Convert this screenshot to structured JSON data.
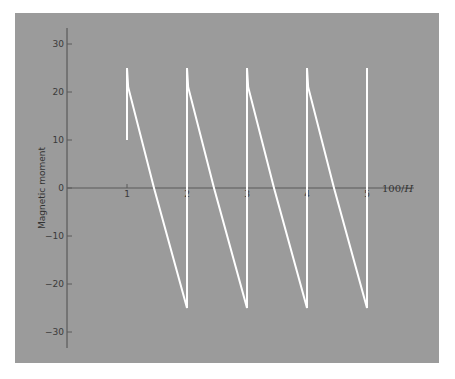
{
  "chart_data": {
    "type": "line",
    "title": "",
    "xlabel": "100/H",
    "xlabel_parts": {
      "prefix": "100/",
      "var": "H"
    },
    "ylabel": "Magnetic moment",
    "xlim": [
      0,
      5.8
    ],
    "ylim": [
      -33,
      33
    ],
    "xticks": [
      1,
      2,
      3,
      4,
      5
    ],
    "xtick_labels": [
      "1",
      "2",
      "3",
      "4",
      "5"
    ],
    "yticks": [
      30,
      20,
      10,
      0,
      -10,
      -20,
      -30
    ],
    "ytick_labels": [
      "30",
      "20",
      "10",
      "0",
      "−10",
      "−20",
      "−30"
    ],
    "grid": false,
    "legend": "none",
    "series": [
      {
        "name": "de Haas–van Alphen oscillation",
        "color": "#ffffff",
        "x": [
          1,
          1,
          1.02,
          1.45,
          2,
          2,
          2.02,
          2.45,
          3,
          3,
          3.02,
          3.45,
          4,
          4,
          4.02,
          4.45,
          5,
          5
        ],
        "y": [
          10,
          25,
          21,
          0,
          -25,
          25,
          21,
          0,
          -25,
          25,
          21,
          0,
          -25,
          25,
          21,
          0,
          -25,
          25
        ]
      }
    ]
  },
  "colors": {
    "panel_background": "#9a9a9a",
    "axis": "#555555",
    "curve": "#ffffff"
  }
}
